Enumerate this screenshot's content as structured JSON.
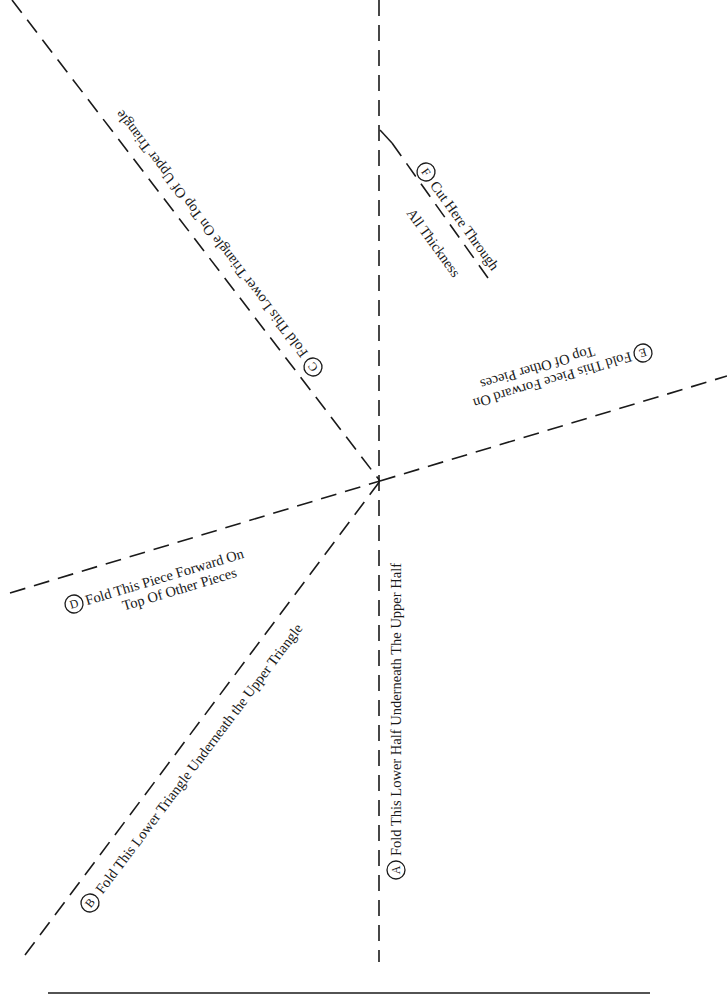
{
  "lines": {
    "A": {
      "letter": "A",
      "text": "Fold This Lower Half Underneath The Upper Half"
    },
    "B": {
      "letter": "B",
      "text": "Fold This Lower Triangle Underneath the Upper Triangle"
    },
    "C": {
      "letter": "C",
      "text": "Fold This Lower Triangle On Top Of Upper Triangle"
    },
    "D": {
      "letter": "D",
      "text1": "Fold This Piece Forward On",
      "text2": "Top Of Other Pieces"
    },
    "E": {
      "letter": "E",
      "text1": "Fold This Piece Forward On",
      "text2": "Top Of Other Pieces"
    },
    "F": {
      "letter": "F",
      "text1": "Cut Here Through",
      "text2": "All Thickness"
    }
  },
  "colors": {
    "ink": "#1a1a1a",
    "paper": "#ffffff"
  }
}
